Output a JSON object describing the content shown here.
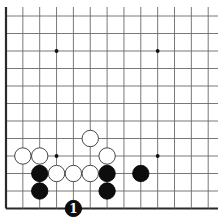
{
  "board": {
    "description": "Go board diagram, bottom-left corner region",
    "origin_x": 6,
    "origin_y": 16,
    "col_spacing": 16.85,
    "row_spacing": 17.5,
    "cols": 13,
    "rows": 12,
    "top_edge_open": true,
    "right_edge_open": true,
    "left_border": true,
    "bottom_border": true,
    "line_extend_right": 218,
    "line_extend_top": 7,
    "star_points": [
      {
        "col": 3,
        "row": 2
      },
      {
        "col": 9,
        "row": 2
      },
      {
        "col": 3,
        "row": 8
      },
      {
        "col": 9,
        "row": 8
      }
    ],
    "stones": [
      {
        "color": "white",
        "col": 1,
        "row": 8
      },
      {
        "color": "white",
        "col": 2,
        "row": 8
      },
      {
        "color": "white",
        "col": 5,
        "row": 7
      },
      {
        "color": "white",
        "col": 6,
        "row": 8
      },
      {
        "color": "white",
        "col": 3,
        "row": 9
      },
      {
        "color": "white",
        "col": 4,
        "row": 9
      },
      {
        "color": "white",
        "col": 5,
        "row": 9
      },
      {
        "color": "black",
        "col": 2,
        "row": 9
      },
      {
        "color": "black",
        "col": 2,
        "row": 10
      },
      {
        "color": "black",
        "col": 6,
        "row": 9
      },
      {
        "color": "black",
        "col": 6,
        "row": 10
      },
      {
        "color": "black",
        "col": 8,
        "row": 9
      },
      {
        "color": "black",
        "col": 4,
        "row": 11,
        "label": "1"
      }
    ],
    "stone_radius": 8.2
  }
}
